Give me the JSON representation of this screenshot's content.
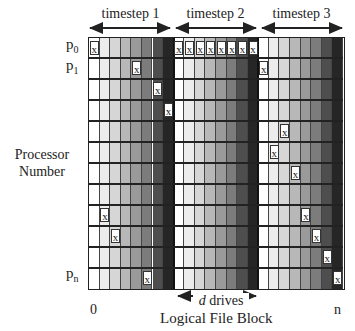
{
  "timesteps": [
    {
      "label": "timestep 1"
    },
    {
      "label": "timestep 2"
    },
    {
      "label": "timestep 3"
    }
  ],
  "processors": {
    "p0": {
      "base": "p",
      "sub": "0"
    },
    "p1": {
      "base": "p",
      "sub": "1"
    },
    "pn": {
      "base": "p",
      "sub": "n"
    }
  },
  "y_axis_label": {
    "line1": "Processor",
    "line2": "Number"
  },
  "x_axis": {
    "start": "0",
    "end": "n",
    "label": "Logical File Block"
  },
  "drives_label": {
    "italic": "d",
    "rest": " drives"
  },
  "mark_symbol": "x",
  "grid": {
    "rows": 12,
    "blocks": 3,
    "cols_per_block": 8,
    "column_shades": [
      "#ffffff",
      "#ececec",
      "#d6d6d6",
      "#b8b8b8",
      "#9a9a9a",
      "#7c7c7c",
      "#4e4e4e",
      "#262626"
    ],
    "marks": [
      {
        "row": 0,
        "block": 0,
        "col": 0
      },
      {
        "row": 1,
        "block": 0,
        "col": 4
      },
      {
        "row": 2,
        "block": 0,
        "col": 6
      },
      {
        "row": 3,
        "block": 0,
        "col": 7
      },
      {
        "row": 8,
        "block": 0,
        "col": 1
      },
      {
        "row": 9,
        "block": 0,
        "col": 2
      },
      {
        "row": 11,
        "block": 0,
        "col": 5
      },
      {
        "row": 0,
        "block": 1,
        "col": 0
      },
      {
        "row": 0,
        "block": 1,
        "col": 1
      },
      {
        "row": 0,
        "block": 1,
        "col": 2
      },
      {
        "row": 0,
        "block": 1,
        "col": 3
      },
      {
        "row": 0,
        "block": 1,
        "col": 4
      },
      {
        "row": 0,
        "block": 1,
        "col": 5
      },
      {
        "row": 0,
        "block": 1,
        "col": 6
      },
      {
        "row": 0,
        "block": 1,
        "col": 7
      },
      {
        "row": 1,
        "block": 2,
        "col": 0
      },
      {
        "row": 4,
        "block": 2,
        "col": 2
      },
      {
        "row": 5,
        "block": 2,
        "col": 1
      },
      {
        "row": 6,
        "block": 2,
        "col": 3
      },
      {
        "row": 8,
        "block": 2,
        "col": 4
      },
      {
        "row": 9,
        "block": 2,
        "col": 5
      },
      {
        "row": 10,
        "block": 2,
        "col": 6
      },
      {
        "row": 11,
        "block": 2,
        "col": 7
      }
    ]
  }
}
